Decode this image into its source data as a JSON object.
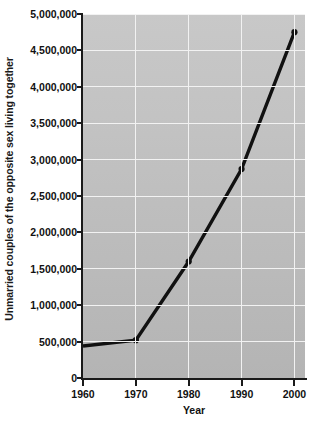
{
  "chart_data": {
    "type": "line",
    "title": "",
    "xlabel": "Year",
    "ylabel": "Unmarried couples of the opposite sex living together",
    "x": [
      1960,
      1970,
      1980,
      1990,
      2000
    ],
    "values": [
      440000,
      520000,
      1600000,
      2870000,
      4750000
    ],
    "series": [
      {
        "name": "Unmarried couples of the opposite sex living together",
        "values": [
          440000,
          520000,
          1600000,
          2870000,
          4750000
        ]
      }
    ],
    "xlim": [
      1960,
      2002
    ],
    "ylim": [
      0,
      5000000
    ],
    "xtick_labels": [
      "1960",
      "1970",
      "1980",
      "1990",
      "2000"
    ],
    "ytick_labels": [
      "0",
      "500,000",
      "1,000,000",
      "1,500,000",
      "2,000,000",
      "2,500,000",
      "3,000,000",
      "3,500,000",
      "4,000,000",
      "4,500,000",
      "5,000,000"
    ],
    "ytick_values": [
      0,
      500000,
      1000000,
      1500000,
      2000000,
      2500000,
      3000000,
      3500000,
      4000000,
      4500000,
      5000000
    ],
    "grid": true,
    "legend": false,
    "colors": {
      "line": "#111111",
      "marker": "#111111",
      "plot_background_top": "#c8c8c8",
      "plot_background_bottom": "#b4b4b4",
      "gridline": "#f2f2f2",
      "axis": "#1a1a1a",
      "text": "#111111",
      "figure_background": "#ffffff"
    }
  }
}
